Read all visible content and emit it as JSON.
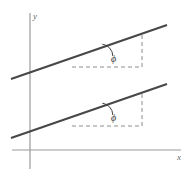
{
  "figure": {
    "kind": "geometry-diagram",
    "width": 191,
    "height": 177,
    "background_color": "#ffffff"
  },
  "axes": {
    "x_axis": {
      "label": "x",
      "label_x": 177,
      "label_y": 160,
      "x1": 12,
      "y1": 150,
      "x2": 181,
      "y2": 150,
      "color": "#9a9a9a",
      "width": 1.2
    },
    "y_axis": {
      "label": "y",
      "label_x": 33,
      "label_y": 19,
      "x1": 30,
      "y1": 13,
      "x2": 30,
      "y2": 169,
      "color": "#9a9a9a",
      "width": 1.2
    }
  },
  "lines": {
    "color": "#474747",
    "width": 2.1,
    "items": [
      {
        "name": "upper-line",
        "x1": 11,
        "y1": 79,
        "x2": 167,
        "y2": 25
      },
      {
        "name": "lower-line",
        "x1": 11,
        "y1": 138,
        "x2": 167,
        "y2": 84
      }
    ]
  },
  "guides": {
    "color": "#8c8c8c",
    "width": 1,
    "dash_pattern": "4,3",
    "items": [
      {
        "name": "upper-horizontal-guide",
        "x1": 72,
        "y1": 67,
        "x2": 142,
        "y2": 67
      },
      {
        "name": "upper-vertical-guide",
        "x1": 142,
        "y1": 67,
        "x2": 142,
        "y2": 34
      },
      {
        "name": "lower-horizontal-guide",
        "x1": 72,
        "y1": 126,
        "x2": 142,
        "y2": 126
      },
      {
        "name": "lower-vertical-guide",
        "x1": 142,
        "y1": 126,
        "x2": 142,
        "y2": 93
      }
    ]
  },
  "angles": [
    {
      "name": "upper-angle",
      "symbol": "ϕ",
      "value_text": "ϕ",
      "vertex_x": 101,
      "vertex_y": 56,
      "label_x": 111,
      "label_y": 62,
      "arc_path": "M 102.3 44.2 A 12 12 0 0 1 112.8 56.0",
      "arc_color": "#3f3f3f",
      "arc_width": 1
    },
    {
      "name": "lower-angle",
      "symbol": "ϕ",
      "value_text": "ϕ",
      "vertex_x": 101,
      "vertex_y": 115,
      "label_x": 111,
      "label_y": 121,
      "arc_path": "M 102.3 103.2 A 12 12 0 0 1 112.8 115.0",
      "arc_color": "#3f3f3f",
      "arc_width": 1
    }
  ]
}
